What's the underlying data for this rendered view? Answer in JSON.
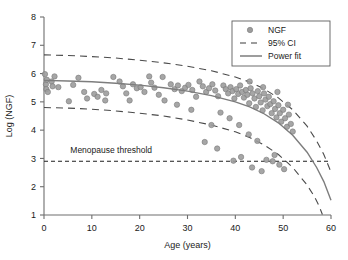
{
  "chart_data": {
    "type": "scatter",
    "title": "",
    "xlabel": "Age (years)",
    "ylabel": "Log (NGF)",
    "xlim": [
      0,
      60
    ],
    "ylim": [
      1,
      8
    ],
    "xticks": [
      0,
      10,
      20,
      30,
      40,
      50,
      60
    ],
    "yticks": [
      1,
      2,
      3,
      4,
      5,
      6,
      7,
      8
    ],
    "grid": false,
    "legend_position": "top-right",
    "legend": [
      {
        "label": "NGF",
        "marker": "circle",
        "color": "#9c9c9c"
      },
      {
        "label": "95% CI",
        "marker": "dashed-line",
        "color": "#3d3d3d"
      },
      {
        "label": "Power fit",
        "marker": "solid-line",
        "color": "#7d7d7d"
      }
    ],
    "annotations": [
      {
        "text": "Menopause threshold",
        "x": 5.5,
        "y": 3.18,
        "line_y": 2.9,
        "line_style": "dashed"
      }
    ],
    "series": [
      {
        "name": "NGF",
        "type": "scatter",
        "color": "#9c9c9c",
        "points": [
          [
            0.2,
            5.98
          ],
          [
            0.4,
            5.62
          ],
          [
            0.5,
            5.45
          ],
          [
            0.6,
            5.78
          ],
          [
            0.8,
            5.35
          ],
          [
            1.6,
            5.72
          ],
          [
            1.8,
            5.55
          ],
          [
            2.2,
            5.9
          ],
          [
            3.0,
            5.52
          ],
          [
            5.2,
            5.02
          ],
          [
            6.1,
            5.6
          ],
          [
            8.4,
            5.35
          ],
          [
            9.0,
            5.12
          ],
          [
            10.5,
            5.28
          ],
          [
            11.2,
            5.18
          ],
          [
            12.0,
            5.42
          ],
          [
            13.0,
            5.3
          ],
          [
            14.5,
            5.88
          ],
          [
            15.8,
            5.72
          ],
          [
            16.5,
            5.55
          ],
          [
            17.2,
            5.3
          ],
          [
            18.6,
            5.62
          ],
          [
            19.4,
            5.48
          ],
          [
            20.2,
            5.52
          ],
          [
            21.0,
            5.35
          ],
          [
            22.4,
            5.68
          ],
          [
            23.1,
            5.5
          ],
          [
            24.0,
            5.25
          ],
          [
            25.2,
            5.05
          ],
          [
            26.5,
            5.62
          ],
          [
            27.3,
            5.45
          ],
          [
            28.0,
            5.58
          ],
          [
            28.8,
            5.38
          ],
          [
            29.5,
            5.5
          ],
          [
            30.2,
            5.6
          ],
          [
            31.0,
            5.42
          ],
          [
            31.8,
            5.18
          ],
          [
            32.5,
            5.72
          ],
          [
            33.2,
            5.55
          ],
          [
            33.9,
            5.35
          ],
          [
            34.5,
            5.48
          ],
          [
            35.2,
            5.62
          ],
          [
            35.8,
            5.4
          ],
          [
            36.4,
            5.2
          ],
          [
            36.9,
            4.62
          ],
          [
            37.5,
            5.58
          ],
          [
            38.0,
            5.45
          ],
          [
            38.5,
            5.3
          ],
          [
            39.0,
            5.52
          ],
          [
            39.4,
            5.38
          ],
          [
            39.8,
            5.12
          ],
          [
            40.2,
            5.45
          ],
          [
            40.6,
            5.28
          ],
          [
            41.0,
            5.58
          ],
          [
            41.4,
            5.35
          ],
          [
            41.8,
            5.15
          ],
          [
            42.2,
            5.42
          ],
          [
            42.5,
            5.25
          ],
          [
            42.9,
            4.95
          ],
          [
            43.2,
            5.48
          ],
          [
            43.6,
            5.3
          ],
          [
            44.0,
            5.12
          ],
          [
            44.3,
            4.82
          ],
          [
            44.7,
            5.38
          ],
          [
            45.0,
            5.2
          ],
          [
            45.3,
            4.98
          ],
          [
            45.7,
            4.7
          ],
          [
            46.0,
            5.3
          ],
          [
            46.3,
            5.08
          ],
          [
            46.7,
            4.85
          ],
          [
            47.0,
            5.18
          ],
          [
            47.3,
            4.92
          ],
          [
            47.6,
            4.6
          ],
          [
            48.0,
            5.02
          ],
          [
            48.3,
            4.75
          ],
          [
            48.6,
            4.45
          ],
          [
            49.0,
            4.88
          ],
          [
            49.3,
            4.6
          ],
          [
            49.6,
            4.3
          ],
          [
            50.0,
            4.72
          ],
          [
            50.4,
            4.42
          ],
          [
            50.8,
            4.12
          ],
          [
            51.2,
            4.55
          ],
          [
            51.6,
            4.22
          ],
          [
            52.0,
            3.95
          ],
          [
            38.8,
            4.42
          ],
          [
            40.8,
            4.18
          ],
          [
            42.8,
            3.85
          ],
          [
            44.6,
            3.62
          ],
          [
            36.2,
            3.35
          ],
          [
            39.6,
            2.92
          ],
          [
            41.2,
            3.05
          ],
          [
            43.5,
            2.68
          ],
          [
            45.5,
            2.55
          ],
          [
            47.8,
            2.9
          ],
          [
            49.2,
            2.78
          ],
          [
            33.6,
            3.58
          ],
          [
            35.0,
            4.18
          ],
          [
            30.8,
            4.72
          ],
          [
            27.8,
            4.9
          ],
          [
            24.8,
            5.88
          ],
          [
            22.0,
            5.9
          ],
          [
            17.9,
            5.05
          ],
          [
            12.8,
            5.05
          ],
          [
            7.2,
            5.85
          ],
          [
            43.0,
            5.72
          ],
          [
            45.8,
            5.52
          ],
          [
            48.8,
            5.35
          ],
          [
            51.0,
            4.9
          ],
          [
            46.5,
            2.95
          ],
          [
            48.2,
            3.12
          ],
          [
            50.2,
            2.62
          ]
        ]
      },
      {
        "name": "Power fit",
        "type": "line",
        "color": "#7d7d7d",
        "path": [
          [
            0,
            5.76
          ],
          [
            5,
            5.74
          ],
          [
            10,
            5.71
          ],
          [
            15,
            5.66
          ],
          [
            20,
            5.59
          ],
          [
            25,
            5.5
          ],
          [
            30,
            5.38
          ],
          [
            35,
            5.22
          ],
          [
            40,
            5.0
          ],
          [
            43,
            4.82
          ],
          [
            46,
            4.58
          ],
          [
            49,
            4.26
          ],
          [
            52,
            3.82
          ],
          [
            55,
            3.22
          ],
          [
            57,
            2.68
          ],
          [
            58.5,
            2.18
          ],
          [
            60,
            1.52
          ]
        ]
      },
      {
        "name": "95% CI upper",
        "type": "line",
        "color": "#3d3d3d",
        "style": "dashed",
        "path": [
          [
            0,
            6.66
          ],
          [
            5,
            6.64
          ],
          [
            10,
            6.6
          ],
          [
            15,
            6.55
          ],
          [
            20,
            6.47
          ],
          [
            25,
            6.38
          ],
          [
            30,
            6.26
          ],
          [
            35,
            6.1
          ],
          [
            40,
            5.88
          ],
          [
            43,
            5.7
          ],
          [
            46,
            5.46
          ],
          [
            49,
            5.14
          ],
          [
            52,
            4.72
          ],
          [
            55,
            4.14
          ],
          [
            57,
            3.62
          ],
          [
            58.5,
            3.14
          ],
          [
            60,
            2.52
          ]
        ]
      },
      {
        "name": "95% CI lower",
        "type": "line",
        "color": "#3d3d3d",
        "style": "dashed",
        "path": [
          [
            0,
            4.8
          ],
          [
            5,
            4.78
          ],
          [
            10,
            4.74
          ],
          [
            15,
            4.68
          ],
          [
            20,
            4.6
          ],
          [
            25,
            4.5
          ],
          [
            30,
            4.36
          ],
          [
            35,
            4.18
          ],
          [
            40,
            3.94
          ],
          [
            43,
            3.74
          ],
          [
            46,
            3.48
          ],
          [
            49,
            3.14
          ],
          [
            52,
            2.68
          ],
          [
            55,
            2.06
          ],
          [
            56.5,
            1.66
          ],
          [
            57.5,
            1.32
          ],
          [
            58.2,
            1.02
          ]
        ]
      }
    ]
  }
}
